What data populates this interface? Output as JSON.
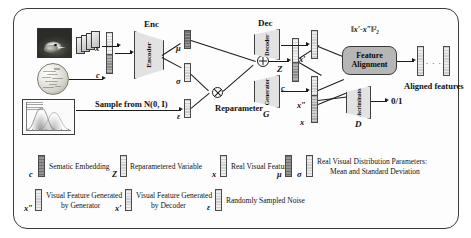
{
  "figure": {
    "kind": "architecture-diagram",
    "title_visible": false,
    "frame_border_color": "#3b3b3b",
    "background_color": "#ffffff",
    "accent_box_color": "#b6b6b6",
    "block_fill_color": "#e2e2e2"
  },
  "pipeline": {
    "encoder_group_label": "Enc",
    "encoder_block_label": "Encoder",
    "decoder_group_label": "Dec",
    "decoder_block_label": "Decoder",
    "generator_block_label": "Generator",
    "generator_short_label": "G",
    "discriminator_block_label": "Discriminator",
    "discriminator_short_label": "D",
    "feature_alignment_line1": "Feature",
    "feature_alignment_line2": "Alignment",
    "sample_note": "Sample from N(0, I)",
    "reparameter_label": "Reparameter",
    "aligned_features_label": "Aligned features",
    "alignment_loss": "‖x′-x″‖²₂",
    "discriminator_output": "0/1",
    "ellipsis": ". . ."
  },
  "symbols": {
    "x": "x",
    "c": "c",
    "mu": "μ",
    "sigma": "σ",
    "epsilon": "ε",
    "z_upper": "Z",
    "c_lower": "c",
    "x_prime": "x′",
    "x_double_prime": "x″",
    "x_real": "x",
    "plus_operator": "⊕",
    "times_operator": "⊗"
  },
  "legend": {
    "row1": [
      {
        "symbol": "c",
        "text": "Sematic Embedding",
        "bar_style": "bar-dark"
      },
      {
        "symbol": "Z",
        "text": "Reparametered Variable",
        "bar_style": "bar-light"
      },
      {
        "symbol": "x",
        "text": "Real Visual Feature",
        "bar_style": "bar-light"
      },
      {
        "symbol": "μ",
        "text": "",
        "bar_style": "bar-dark"
      },
      {
        "symbol": "σ",
        "text": "Real Visual Distribution Parameters:",
        "text_line2": "Mean and Standard Deviation",
        "bar_style": "bar-light"
      }
    ],
    "row2": [
      {
        "symbol": "x″",
        "text": "Visual Feature Generated",
        "text_line2": "by Generator",
        "bar_style": "bar-light"
      },
      {
        "symbol": "x′",
        "text": "Visual Feature Generated",
        "text_line2": "by Decoder",
        "bar_style": "bar-light"
      },
      {
        "symbol": "ε",
        "text": "Randomly Sampled Noise",
        "bar_style": "bar-light"
      }
    ]
  },
  "inputs": {
    "image_caption": "",
    "bird_image_name": "bird-photo",
    "sphere_image_name": "semantic-word-sphere",
    "plot_image_name": "gaussian-distribution-plot"
  }
}
